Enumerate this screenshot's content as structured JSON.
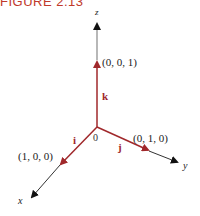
{
  "figure": {
    "title": "FIGURE 2.13"
  },
  "diagram": {
    "origin_label": "0",
    "axes": {
      "x": {
        "label": "x"
      },
      "y": {
        "label": "y"
      },
      "z": {
        "label": "z"
      }
    },
    "vectors": [
      {
        "name": "i",
        "label": "i",
        "point_label": "(1, 0, 0)"
      },
      {
        "name": "j",
        "label": "j",
        "point_label": "(0, 1, 0)"
      },
      {
        "name": "k",
        "label": "k",
        "point_label": "(0, 0, 1)"
      }
    ],
    "colors": {
      "vector": "#a0282b",
      "axis": "#222222",
      "title": "#c0392b"
    }
  }
}
